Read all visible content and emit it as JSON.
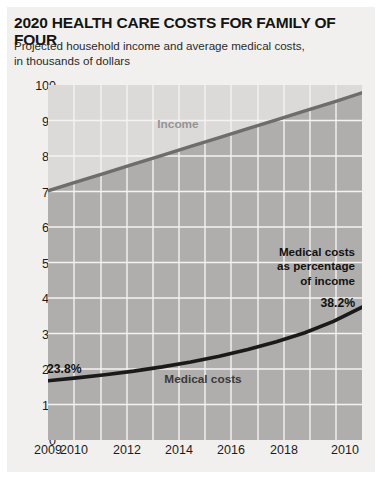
{
  "title": "2020 HEALTH CARE COSTS FOR FAMILY OF FOUR",
  "subtitle": "Projected household income and average medical costs,\nin thousands of dollars",
  "labels": {
    "income": "Income",
    "medical": "Medical costs",
    "annotation_line1": "Medical costs",
    "annotation_line2": "as percentage",
    "annotation_line3": "of income",
    "pct_start": "23.8%",
    "pct_end": "38.2%"
  },
  "colors": {
    "plot_background": "#e8e6e4",
    "above_income_fill": "#dcdad8",
    "below_income_fill": "#b0aeac",
    "income_line": "#6f6d6b",
    "medical_line": "#1a1a1a",
    "gridline": "#f4f3f2",
    "page_background": "#f2f0ee",
    "title_text": "#141414"
  },
  "chart_data": {
    "type": "area",
    "title": "2020 HEALTH CARE COSTS FOR FAMILY OF FOUR",
    "subtitle": "Projected household income and average medical costs, in thousands of dollars",
    "xlabel": "",
    "ylabel": "in thousands of dollars",
    "ylim": [
      0,
      100
    ],
    "ytick_labels": [
      "100",
      "90",
      "80",
      "70",
      "60",
      "50",
      "40",
      "30",
      "20",
      "10",
      "0"
    ],
    "ytick_values": [
      100,
      90,
      80,
      70,
      60,
      50,
      40,
      30,
      20,
      10,
      0
    ],
    "xtick_labels": [
      "2009",
      "2010",
      "2012",
      "2014",
      "2016",
      "2018",
      "2010"
    ],
    "xtick_values": [
      2009,
      2010,
      2012,
      2014,
      2016,
      2018,
      2020
    ],
    "x": [
      2009,
      2010,
      2011,
      2012,
      2013,
      2014,
      2015,
      2016,
      2017,
      2018,
      2019,
      2020
    ],
    "grid": true,
    "legend_position": "inline-labels",
    "series": [
      {
        "name": "Income",
        "values": [
          70.2,
          72.7,
          75.2,
          77.7,
          80.2,
          82.7,
          85.2,
          87.7,
          90.2,
          92.7,
          95.2,
          97.8
        ],
        "color": "#6f6d6b"
      },
      {
        "name": "Medical costs",
        "values": [
          16.7,
          17.5,
          18.4,
          19.4,
          20.6,
          22.0,
          23.6,
          25.5,
          27.7,
          30.2,
          33.4,
          37.4
        ],
        "color": "#1a1a1a"
      }
    ],
    "annotations": [
      {
        "text": "23.8%",
        "x": 2009,
        "note": "medical costs as percentage of income at start"
      },
      {
        "text": "38.2%",
        "x": 2020,
        "note": "medical costs as percentage of income at end"
      },
      {
        "text": "Medical costs as percentage of income",
        "x": 2018
      }
    ]
  }
}
